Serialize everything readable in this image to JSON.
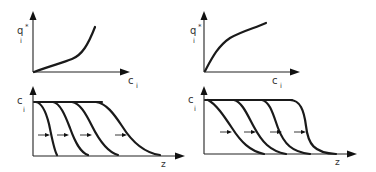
{
  "figure": {
    "panels": [
      {
        "id": "left",
        "isotherm": {
          "shape": "convex-unfavorable",
          "ylabel": "q",
          "ylabel_sup": "*",
          "ylabel_sub": "i",
          "xlabel": "c",
          "xlabel_sub": "i"
        },
        "profile": {
          "behavior": "spreading fronts",
          "ylabel": "c",
          "ylabel_sub": "i",
          "xlabel": "z",
          "front_count": 4
        }
      },
      {
        "id": "right",
        "isotherm": {
          "shape": "concave-favorable",
          "ylabel": "q",
          "ylabel_sup": "*",
          "ylabel_sub": "i",
          "xlabel": "c",
          "xlabel_sub": "i"
        },
        "profile": {
          "behavior": "self-sharpening fronts",
          "ylabel": "c",
          "ylabel_sub": "i",
          "xlabel": "z",
          "front_count": 4
        }
      }
    ]
  }
}
